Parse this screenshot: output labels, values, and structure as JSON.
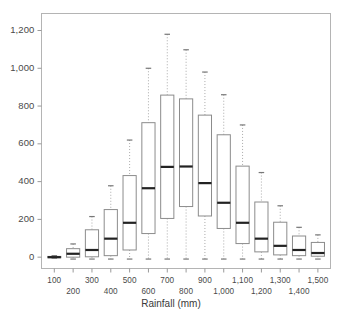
{
  "chart_data": {
    "type": "box",
    "title": "",
    "xlabel": "Rainfall (mm)",
    "ylabel": "",
    "grid": false,
    "legend": null,
    "ylim": [
      -60,
      1290
    ],
    "yticks": [
      0,
      200,
      400,
      600,
      800,
      1000,
      1200
    ],
    "ytick_labels": [
      "0",
      "200",
      "400",
      "600",
      "800",
      "1,000",
      "1,200"
    ],
    "categories": [
      "100",
      "200",
      "300",
      "400",
      "500",
      "600",
      "700",
      "800",
      "900",
      "1,000",
      "1,100",
      "1,200",
      "1,300",
      "1,400",
      "1,500"
    ],
    "xtick_labels_top_row": [
      "100",
      "300",
      "500",
      "700",
      "900",
      "1,100",
      "1,300",
      "1,500"
    ],
    "xtick_labels_bottom_row": [
      "200",
      "400",
      "600",
      "800",
      "1,000",
      "1,200",
      "1,400"
    ],
    "boxes": [
      {
        "category": "100",
        "whisker_low": -5,
        "q1": -3,
        "median": 0,
        "q3": 4,
        "whisker_high": 8
      },
      {
        "category": "200",
        "whisker_low": -10,
        "q1": 0,
        "median": 18,
        "q3": 45,
        "whisker_high": 70
      },
      {
        "category": "300",
        "whisker_low": -10,
        "q1": 2,
        "median": 38,
        "q3": 145,
        "whisker_high": 215
      },
      {
        "category": "400",
        "whisker_low": -10,
        "q1": 8,
        "median": 98,
        "q3": 252,
        "whisker_high": 378
      },
      {
        "category": "500",
        "whisker_low": -10,
        "q1": 38,
        "median": 182,
        "q3": 432,
        "whisker_high": 620
      },
      {
        "category": "600",
        "whisker_low": -10,
        "q1": 125,
        "median": 365,
        "q3": 712,
        "whisker_high": 1000
      },
      {
        "category": "700",
        "whisker_low": -10,
        "q1": 205,
        "median": 478,
        "q3": 858,
        "whisker_high": 1180
      },
      {
        "category": "800",
        "whisker_low": -10,
        "q1": 268,
        "median": 480,
        "q3": 838,
        "whisker_high": 1098
      },
      {
        "category": "900",
        "whisker_low": -10,
        "q1": 218,
        "median": 392,
        "q3": 752,
        "whisker_high": 980
      },
      {
        "category": "1,000",
        "whisker_low": -10,
        "q1": 152,
        "median": 288,
        "q3": 648,
        "whisker_high": 860
      },
      {
        "category": "1,100",
        "whisker_low": -10,
        "q1": 72,
        "median": 182,
        "q3": 482,
        "whisker_high": 700
      },
      {
        "category": "1,200",
        "whisker_low": -10,
        "q1": 28,
        "median": 98,
        "q3": 292,
        "whisker_high": 448
      },
      {
        "category": "1,300",
        "whisker_low": -10,
        "q1": 12,
        "median": 60,
        "q3": 185,
        "whisker_high": 272
      },
      {
        "category": "1,400",
        "whisker_low": -10,
        "q1": 8,
        "median": 38,
        "q3": 112,
        "whisker_high": 158
      },
      {
        "category": "1,500",
        "whisker_low": -10,
        "q1": 5,
        "median": 22,
        "q3": 78,
        "whisker_high": 118
      }
    ],
    "style": {
      "box_stroke": "#8c8c8c",
      "median_stroke": "#222222",
      "whisker_stroke": "#aaaaaa",
      "whisker_dash": "1,2",
      "cap_stroke": "#777777",
      "frame_stroke": "#b4b4b4",
      "tick_stroke": "#9a9a9a",
      "background": "#ffffff"
    }
  }
}
